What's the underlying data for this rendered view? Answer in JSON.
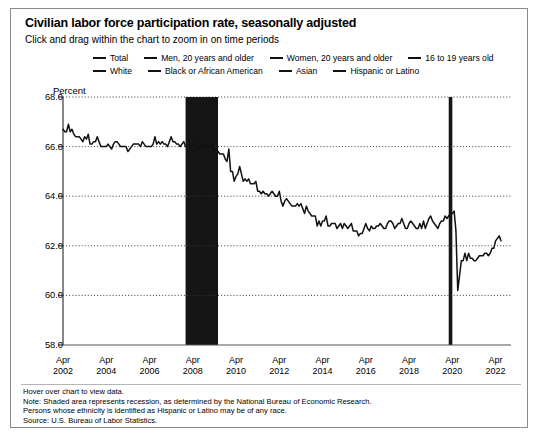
{
  "chart_data": {
    "type": "line",
    "title": "Civilian labor force participation rate, seasonally adjusted",
    "subtitle": "Click and drag within the chart to zoom in on time periods",
    "ylabel": "Percent",
    "xlabel": "",
    "ylim": [
      58.0,
      68.0
    ],
    "ytick_labels": [
      "68.0",
      "66.0",
      "64.0",
      "62.0",
      "60.0",
      "58.0"
    ],
    "ytick_values": [
      68.0,
      66.0,
      64.0,
      62.0,
      60.0,
      58.0
    ],
    "grid": "horizontal-dotted",
    "legend_position": "top",
    "xtick_labels": [
      [
        "Apr",
        "2002"
      ],
      [
        "Apr",
        "2004"
      ],
      [
        "Apr",
        "2006"
      ],
      [
        "Apr",
        "2008"
      ],
      [
        "Apr",
        "2010"
      ],
      [
        "Apr",
        "2012"
      ],
      [
        "Apr",
        "2014"
      ],
      [
        "Apr",
        "2016"
      ],
      [
        "Apr",
        "2018"
      ],
      [
        "Apr",
        "2020"
      ],
      [
        "Apr",
        "2022"
      ]
    ],
    "xlim": [
      "2002-04",
      "2022-04"
    ],
    "legend": [
      {
        "label": "Total",
        "color": "#111111"
      },
      {
        "label": "Men, 20 years and older",
        "color": "#111111"
      },
      {
        "label": "Women, 20 years and older",
        "color": "#111111"
      },
      {
        "label": "16 to 19 years old",
        "color": "#111111"
      },
      {
        "label": "White",
        "color": "#111111"
      },
      {
        "label": "Black or African American",
        "color": "#111111"
      },
      {
        "label": "Asian",
        "color": "#111111"
      },
      {
        "label": "Hispanic or Latino",
        "color": "#111111"
      }
    ],
    "shaded_regions": [
      {
        "name": "recession-2008",
        "start": "2007-12",
        "end": "2009-06",
        "color": "#151515"
      },
      {
        "name": "recession-2020",
        "start": "2020-02",
        "end": "2020-04",
        "color": "#151515"
      }
    ],
    "series": [
      {
        "name": "Total",
        "color": "#111111",
        "values": [
          66.7,
          66.6,
          66.6,
          66.9,
          66.6,
          66.7,
          66.5,
          66.4,
          66.4,
          66.4,
          66.3,
          66.2,
          66.4,
          66.3,
          66.5,
          66.1,
          66.1,
          66.2,
          66.2,
          66.4,
          66.2,
          66.0,
          66.0,
          66.0,
          66.0,
          66.1,
          66.0,
          65.9,
          66.1,
          66.2,
          66.2,
          66.1,
          66.0,
          66.0,
          66.0,
          66.0,
          65.8,
          65.9,
          66.0,
          66.1,
          66.1,
          66.1,
          66.1,
          66.0,
          66.2,
          66.1,
          66.0,
          66.0,
          66.0,
          66.0,
          66.1,
          66.4,
          66.1,
          66.2,
          66.1,
          66.2,
          66.1,
          66.1,
          66.0,
          66.2,
          66.4,
          66.2,
          66.2,
          66.1,
          66.1,
          66.0,
          66.1,
          66.2,
          66.0,
          66.0,
          66.0,
          66.0,
          66.2,
          66.0,
          66.1,
          65.9,
          66.0,
          66.0,
          66.0,
          66.1,
          66.0,
          66.0,
          66.0,
          66.0,
          65.8,
          65.9,
          65.8,
          65.7,
          65.7,
          65.7,
          65.5,
          65.4,
          65.9,
          65.0,
          65.0,
          64.6,
          64.8,
          64.9,
          65.2,
          64.9,
          64.6,
          64.7,
          64.6,
          64.7,
          64.5,
          64.5,
          64.5,
          64.6,
          64.2,
          64.2,
          64.1,
          64.2,
          64.1,
          64.1,
          64.0,
          64.1,
          64.2,
          64.1,
          64.0,
          64.0,
          64.2,
          63.8,
          63.6,
          63.8,
          63.9,
          63.8,
          63.7,
          63.6,
          63.6,
          63.6,
          63.7,
          63.6,
          63.7,
          63.5,
          63.3,
          63.6,
          63.4,
          63.3,
          63.2,
          63.2,
          63.2,
          62.8,
          63.0,
          62.8,
          63.0,
          63.0,
          63.2,
          62.8,
          62.8,
          62.9,
          62.9,
          62.9,
          62.7,
          62.8,
          62.9,
          62.7,
          62.9,
          62.8,
          62.7,
          62.8,
          62.9,
          62.6,
          62.6,
          62.6,
          62.4,
          62.5,
          62.5,
          62.7,
          62.9,
          62.7,
          62.6,
          62.8,
          62.7,
          62.7,
          62.8,
          62.8,
          62.9,
          62.8,
          62.7,
          62.7,
          62.9,
          63.0,
          63.0,
          62.9,
          62.7,
          62.8,
          62.9,
          62.9,
          63.1,
          62.9,
          62.7,
          62.7,
          62.9,
          63.0,
          62.9,
          62.8,
          62.7,
          62.7,
          62.9,
          62.7,
          63.0,
          62.7,
          62.9,
          63.1,
          63.2,
          63.0,
          62.9,
          62.8,
          62.7,
          62.9,
          63.0,
          63.0,
          63.2,
          63.1,
          63.2,
          63.3,
          63.3,
          63.4,
          62.6,
          60.2,
          60.8,
          61.4,
          61.4,
          61.7,
          61.4,
          61.7,
          61.5,
          61.5,
          61.4,
          61.4,
          61.5,
          61.6,
          61.6,
          61.6,
          61.7,
          61.7,
          61.6,
          61.7,
          61.9,
          61.9,
          62.2,
          62.3,
          62.4,
          62.2
        ]
      }
    ]
  },
  "footer": {
    "lines": [
      "Hover over chart to view data.",
      "Note: Shaded area represents recession, as determined by the National Bureau of Economic Research.",
      "Persons whose ethnicity is identified as Hispanic or Latino may be of any race.",
      "Source: U.S. Bureau of Labor Statistics."
    ]
  }
}
